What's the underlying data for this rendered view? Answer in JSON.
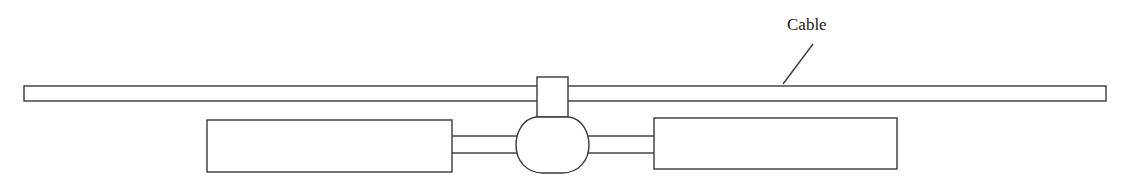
{
  "diagram": {
    "labels": {
      "cable": "Cable"
    },
    "colors": {
      "stroke": "#3a3a3a",
      "fill": "#ffffff",
      "text": "#222222"
    },
    "components": [
      {
        "id": "cable",
        "shape": "rectangle",
        "label": "Cable"
      },
      {
        "id": "clamp",
        "shape": "rectangle"
      },
      {
        "id": "central-body",
        "shape": "rounded-ellipse"
      },
      {
        "id": "left-arm",
        "shape": "bar"
      },
      {
        "id": "right-arm",
        "shape": "bar"
      },
      {
        "id": "left-box",
        "shape": "rectangle"
      },
      {
        "id": "right-box",
        "shape": "rectangle"
      }
    ]
  }
}
